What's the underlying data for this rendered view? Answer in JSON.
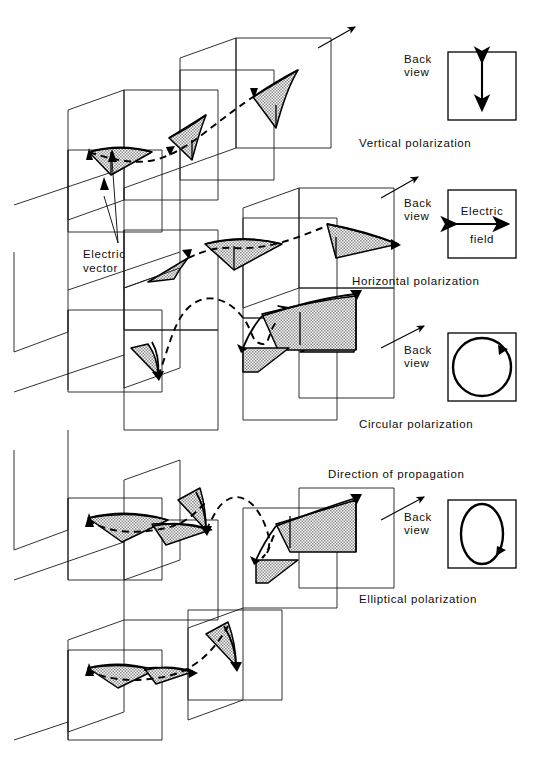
{
  "figure": {
    "background_color": "#ffffff",
    "ink_color": "#0d0d0d",
    "stipple_color": "#b3b3b3"
  },
  "annotations": {
    "electric_vector": "Electric\nvector",
    "electric_vector_line1": "Electric",
    "electric_vector_line2": "vector",
    "direction_of_propagation": "Direction of propagation"
  },
  "rows": [
    {
      "id": "vertical",
      "caption": "Vertical polarization",
      "back_view_label_line1": "Back",
      "back_view_label_line2": "view",
      "back_view_shape": "double-headed-vertical-arrow",
      "field_label_line1": "",
      "field_label_line2": ""
    },
    {
      "id": "horizontal",
      "caption": "Horizontal polarization",
      "back_view_label_line1": "Back",
      "back_view_label_line2": "view",
      "back_view_shape": "double-headed-horizontal-arrow",
      "field_label_line1": "Electric",
      "field_label_line2": "field"
    },
    {
      "id": "circular",
      "caption": "Circular polarization",
      "back_view_label_line1": "Back",
      "back_view_label_line2": "view",
      "back_view_shape": "circle-with-clockwise-arrow",
      "field_label_line1": "",
      "field_label_line2": ""
    },
    {
      "id": "elliptical",
      "caption": "Elliptical polarization",
      "back_view_label_line1": "Back",
      "back_view_label_line2": "view",
      "back_view_shape": "ellipse-with-clockwise-arrow",
      "field_label_line1": "",
      "field_label_line2": ""
    }
  ]
}
